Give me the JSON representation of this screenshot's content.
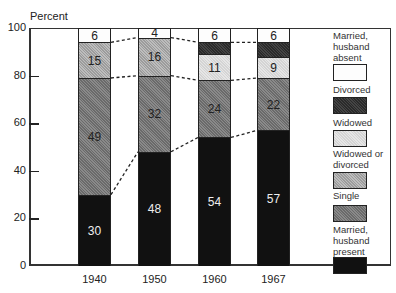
{
  "chart_data": {
    "type": "bar",
    "stacked": true,
    "title": "",
    "ylabel": "Percent",
    "xlabel": "",
    "ylim": [
      0,
      100
    ],
    "yticks": [
      0,
      20,
      40,
      60,
      80,
      100
    ],
    "grid": false,
    "legend_position": "right",
    "categories": [
      "1940",
      "1950",
      "1960",
      "1967"
    ],
    "series": [
      {
        "name": "Married, husband present",
        "values": [
          30,
          48,
          54,
          57
        ],
        "labels": [
          "30",
          "48",
          "54",
          "57"
        ]
      },
      {
        "name": "Single",
        "values": [
          49,
          32,
          24,
          22
        ],
        "labels": [
          "49",
          "32",
          "24",
          "22"
        ]
      },
      {
        "name": "Widowed or divorced",
        "values": [
          15,
          16,
          null,
          null
        ],
        "labels": [
          "15",
          "16",
          "",
          ""
        ]
      },
      {
        "name": "Widowed",
        "values": [
          null,
          null,
          11,
          9
        ],
        "labels": [
          "",
          "",
          "11",
          "9"
        ]
      },
      {
        "name": "Divorced",
        "values": [
          null,
          null,
          5,
          6
        ],
        "labels": [
          "",
          "",
          "",
          ""
        ]
      },
      {
        "name": "Married, husband absent",
        "values": [
          6,
          4,
          6,
          6
        ],
        "labels": [
          "6",
          "4",
          "6",
          "6"
        ]
      }
    ],
    "annotations": "Dashed lines connect segment boundaries between adjacent bars"
  },
  "axis": {
    "y_title": "Percent",
    "y_ticks": [
      "0",
      "20",
      "40",
      "60",
      "80",
      "100"
    ],
    "x_ticks": [
      "1940",
      "1950",
      "1960",
      "1967"
    ]
  },
  "legend": [
    {
      "key": "absent",
      "label_lines": [
        "Married,",
        "husband",
        "absent"
      ]
    },
    {
      "key": "divorced",
      "label_lines": [
        "Divorced"
      ]
    },
    {
      "key": "widowed",
      "label_lines": [
        "Widowed"
      ]
    },
    {
      "key": "wd",
      "label_lines": [
        "Widowed or",
        "divorced"
      ]
    },
    {
      "key": "single",
      "label_lines": [
        "Single"
      ]
    },
    {
      "key": "present",
      "label_lines": [
        "Married,",
        "husband",
        "present"
      ]
    }
  ]
}
